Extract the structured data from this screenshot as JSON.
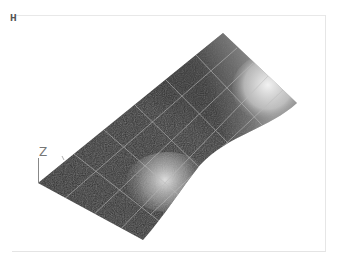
{
  "viewport": {
    "view_label": "H",
    "axis_label": "Z",
    "render_mode": "shaded-surface-with-mesh",
    "colors": {
      "background": "#ffffff",
      "frame": "#e6e6e6",
      "surface_dark": "#2a2a2a",
      "surface_mid": "#555555",
      "surface_light": "#e6e6e6",
      "mesh_lines": "#bdbdbd",
      "axis": "#888888"
    }
  }
}
